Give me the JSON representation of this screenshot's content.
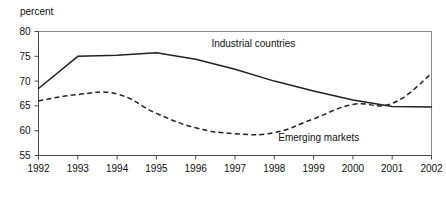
{
  "chart_data": {
    "type": "line",
    "title": "",
    "subtitle": "",
    "xlabel": "",
    "ylabel": "percent",
    "categories": [
      "1992",
      "1993",
      "1994",
      "1995",
      "1996",
      "1997",
      "1998",
      "1999",
      "2000",
      "2001",
      "2002"
    ],
    "x": [
      1992,
      1993,
      1994,
      1995,
      1996,
      1997,
      1998,
      1999,
      2000,
      2001,
      2002
    ],
    "xlim": [
      1992,
      2002
    ],
    "ylim": [
      55,
      80
    ],
    "yticks": [
      55,
      60,
      65,
      70,
      75,
      80
    ],
    "ytick_labels": [
      "55",
      "60",
      "65",
      "70",
      "75",
      "80"
    ],
    "xtick_labels": [
      "1992",
      "1993",
      "1994",
      "1995",
      "1996",
      "1997",
      "1998",
      "1999",
      "2000",
      "2001",
      "2002"
    ],
    "grid": false,
    "legend_position": "inline-annotations",
    "series": [
      {
        "name": "Industrial countries",
        "style": "solid",
        "color": "#222222",
        "values": [
          68.5,
          75.0,
          75.2,
          75.7,
          74.4,
          72.4,
          70.0,
          68.0,
          66.2,
          64.9,
          64.8
        ]
      },
      {
        "name": "Emerging markets",
        "style": "dashed",
        "color": "#222222",
        "values": [
          66.0,
          67.3,
          67.4,
          63.5,
          60.6,
          59.4,
          59.6,
          62.4,
          65.3,
          65.5,
          71.5
        ]
      }
    ],
    "annotations": [
      {
        "text": "Industrial countries",
        "x": 1996.4,
        "y": 76.9
      },
      {
        "text": "Emerging markets",
        "x": 1998.1,
        "y": 57.9
      }
    ]
  },
  "axis": {
    "y_unit_label": "percent"
  }
}
